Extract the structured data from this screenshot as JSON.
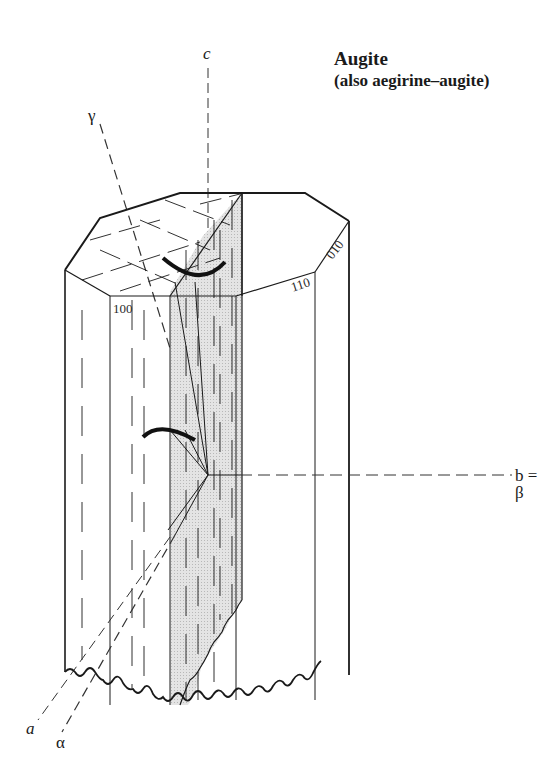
{
  "diagram": {
    "title": "Augite",
    "subtitle": "(also aegirine–augite)",
    "axes": {
      "c": "c",
      "gamma": "γ",
      "b_beta": "b = β",
      "a": "a",
      "alpha": "α"
    },
    "faces": {
      "f100": "100",
      "f110": "110",
      "f010": "010"
    },
    "colors": {
      "line": "#1a1a1a",
      "shade": "#d9d9d9",
      "background": "#ffffff"
    }
  }
}
